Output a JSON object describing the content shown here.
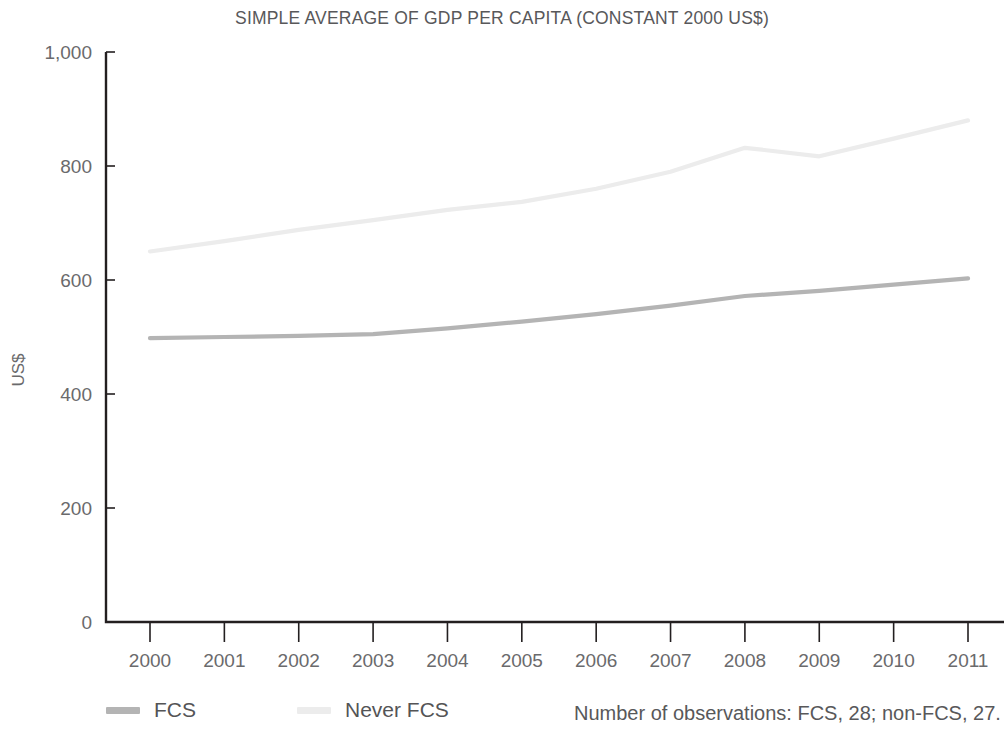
{
  "chart_data": {
    "type": "line",
    "title": "SIMPLE AVERAGE OF GDP PER CAPITA (CONSTANT 2000 US$)",
    "xlabel": "",
    "ylabel": "US$",
    "x": [
      2000,
      2001,
      2002,
      2003,
      2004,
      2005,
      2006,
      2007,
      2008,
      2009,
      2010,
      2011
    ],
    "xtick_labels": [
      "2000",
      "2001",
      "2002",
      "2003",
      "2004",
      "2005",
      "2006",
      "2007",
      "2008",
      "2009",
      "2010",
      "2011"
    ],
    "ytick_labels": [
      "0",
      "200",
      "400",
      "600",
      "800",
      "1,000"
    ],
    "yticks": [
      0,
      200,
      400,
      600,
      800,
      1000
    ],
    "ylim": [
      0,
      1000
    ],
    "xlim": [
      2000,
      2011
    ],
    "grid": false,
    "legend_position": "bottom-left",
    "series": [
      {
        "name": "FCS",
        "color": "#b4b4b4",
        "values": [
          498,
          500,
          502,
          505,
          515,
          527,
          540,
          555,
          572,
          581,
          592,
          603
        ]
      },
      {
        "name": "Never FCS",
        "color": "#ececec",
        "values": [
          650,
          668,
          688,
          705,
          723,
          737,
          760,
          790,
          832,
          817,
          848,
          880
        ]
      }
    ],
    "annotations": [
      "Number of observations: FCS, 28; non-FCS, 27."
    ]
  },
  "legend": {
    "items": [
      {
        "label": "FCS",
        "color": "#b4b4b4"
      },
      {
        "label": "Never FCS",
        "color": "#ececec"
      }
    ]
  },
  "footnote": "Number of observations: FCS, 28; non-FCS, 27.",
  "colors": {
    "axis": "#231f20",
    "text": "#58585a",
    "fcs": "#b4b4b4",
    "never_fcs": "#ececec",
    "background": "#ffffff"
  }
}
